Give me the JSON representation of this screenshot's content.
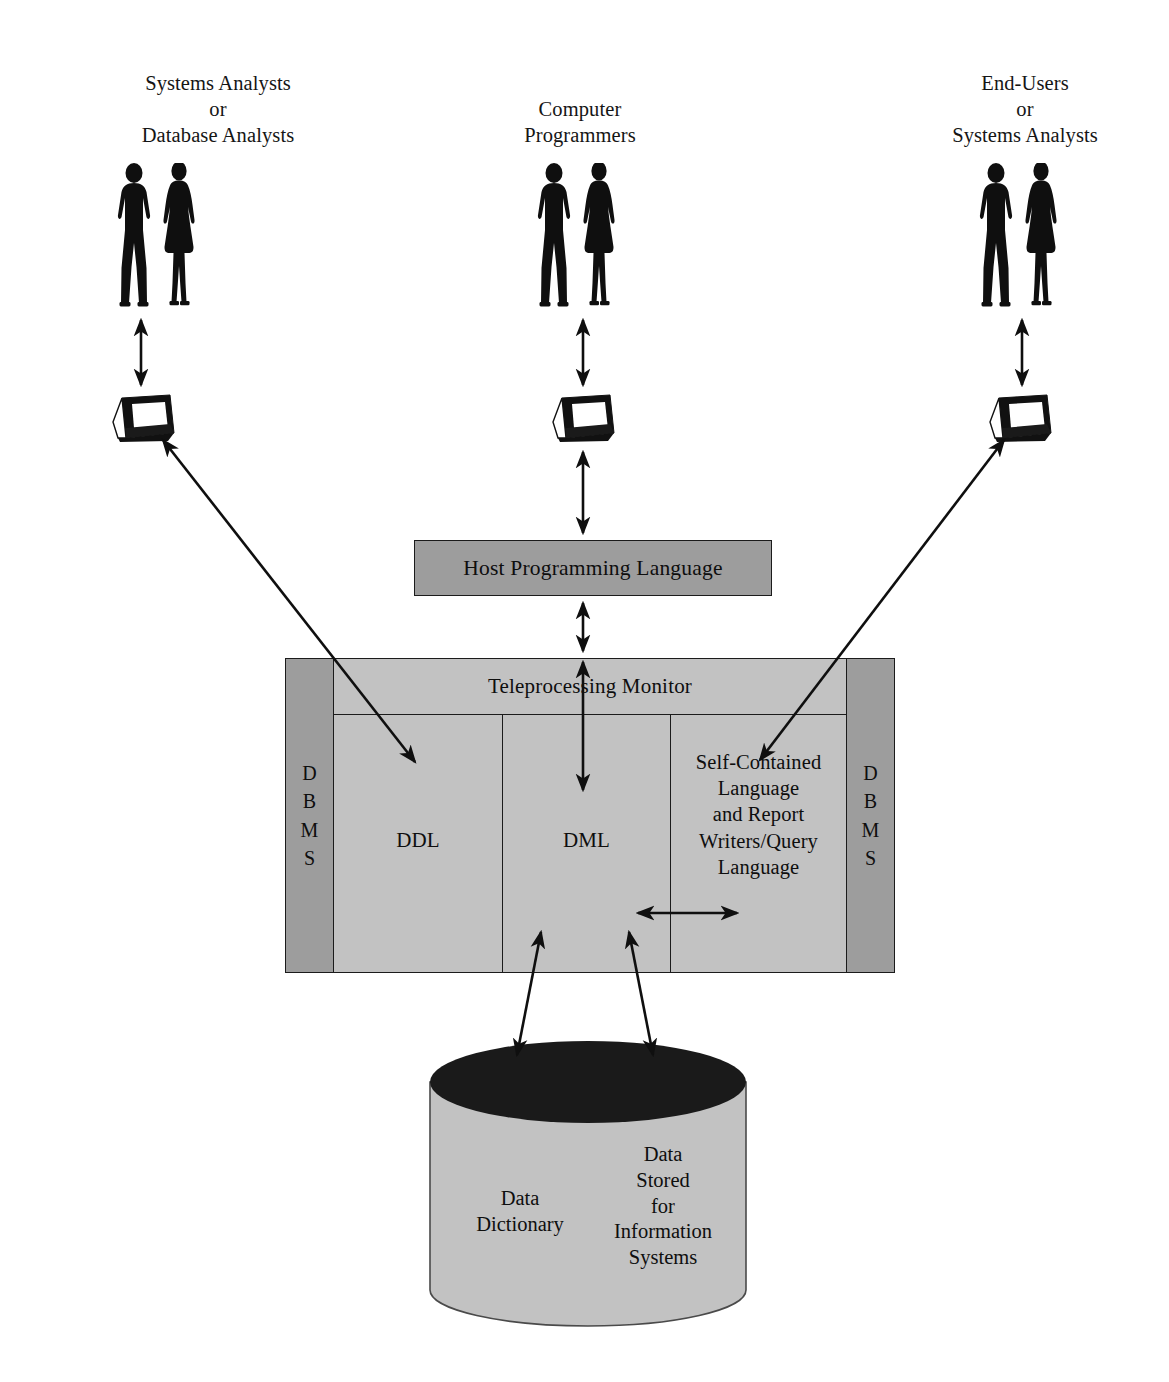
{
  "diagram": {
    "title_present": false,
    "colors": {
      "background": "#ffffff",
      "outline": "#1b1b1b",
      "box_gray_dark": "#9d9d9d",
      "box_gray_light": "#c2c2c2",
      "cylinder_top": "#1a1a1a",
      "cylinder_body": "#c2c2c2",
      "text": "#0e0e0e"
    }
  },
  "actors": [
    {
      "id": "left",
      "label": "Systems Analysts\nor\nDatabase Analysts",
      "icon_people": "two-people-icon",
      "icon_terminal": "computer-terminal-icon"
    },
    {
      "id": "center",
      "label": "Computer\nProgrammers",
      "icon_people": "two-people-icon",
      "icon_terminal": "computer-terminal-icon"
    },
    {
      "id": "right",
      "label": "End-Users\nor\nSystems Analysts",
      "icon_people": "two-people-icon",
      "icon_terminal": "computer-terminal-icon"
    }
  ],
  "host_box": {
    "label": "Host Programming Language"
  },
  "dbms_block": {
    "left_bar": [
      "D",
      "B",
      "M",
      "S"
    ],
    "right_bar": [
      "D",
      "B",
      "M",
      "S"
    ],
    "teleprocessing_label": "Teleprocessing Monitor",
    "columns": [
      {
        "id": "ddl",
        "label": "DDL"
      },
      {
        "id": "dml",
        "label": "DML"
      },
      {
        "id": "scl",
        "label": "Self-Contained\nLanguage\nand Report\nWriters/Query\nLanguage"
      }
    ]
  },
  "database": {
    "left_label": "Data\nDictionary",
    "right_label": "Data\nStored\nfor\nInformation\nSystems"
  },
  "connections": [
    {
      "from": "left-people",
      "to": "left-terminal",
      "style": "double-arrow-vertical"
    },
    {
      "from": "center-people",
      "to": "center-terminal",
      "style": "double-arrow-vertical"
    },
    {
      "from": "right-people",
      "to": "right-terminal",
      "style": "double-arrow-vertical"
    },
    {
      "from": "center-terminal",
      "to": "host-box",
      "style": "double-arrow-vertical"
    },
    {
      "from": "host-box",
      "to": "teleprocessing-monitor",
      "style": "double-arrow-vertical"
    },
    {
      "from": "left-terminal",
      "to": "ddl-column",
      "style": "double-arrow-diagonal"
    },
    {
      "from": "right-terminal",
      "to": "self-contained-column",
      "style": "double-arrow-diagonal"
    },
    {
      "from": "dml-column",
      "to": "self-contained-column",
      "style": "double-arrow-horizontal"
    },
    {
      "from": "dbms-block",
      "to": "database-cylinder",
      "style": "double-arrow-diagonal"
    },
    {
      "from": "dbms-block",
      "to": "database-cylinder",
      "style": "double-arrow-diagonal"
    }
  ]
}
